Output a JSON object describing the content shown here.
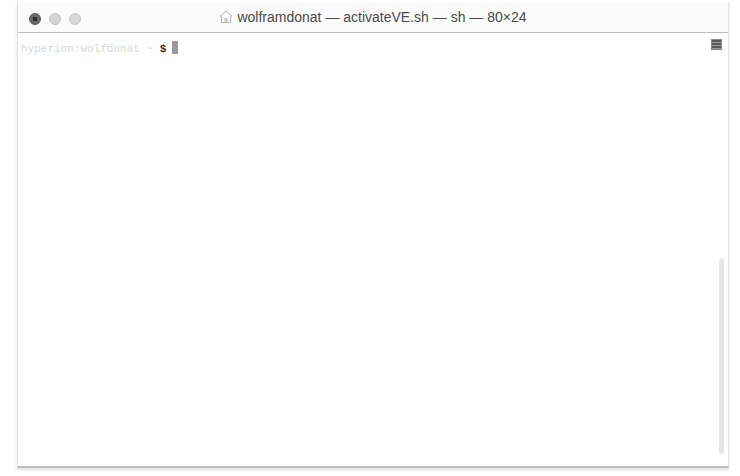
{
  "window": {
    "title": "wolframdonat — activateVE.sh — sh — 80×24",
    "proxy_icon": "home-folder-icon",
    "traffic_lights": [
      "close",
      "minimize",
      "zoom"
    ]
  },
  "terminal": {
    "prompt_prefix": "hyperion:wolfdonat ~ ",
    "prompt_symbol": "$",
    "input": "",
    "cursor": "block"
  },
  "scrollbar": {
    "thumb_position": "bottom"
  }
}
